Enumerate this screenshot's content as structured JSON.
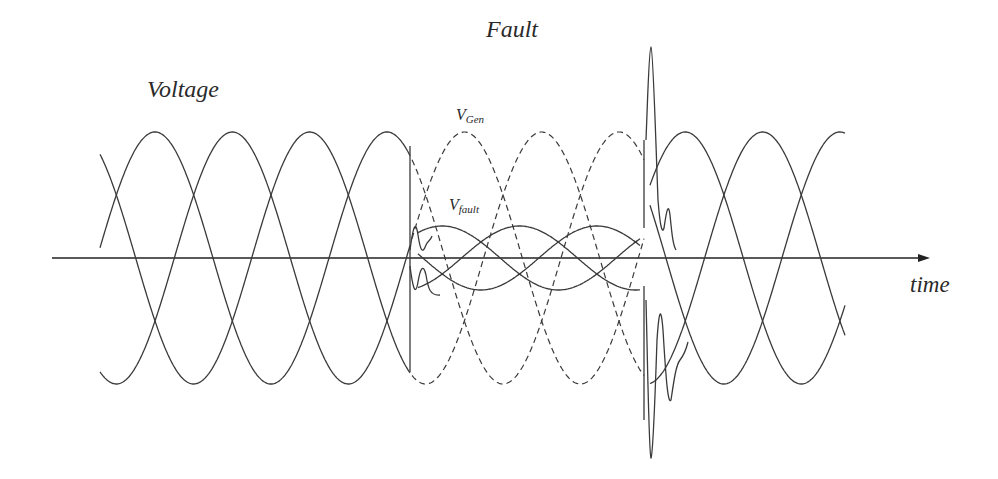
{
  "labels": {
    "voltage": "Voltage",
    "fault": "Fault",
    "time": "time",
    "v_gen_main": "V",
    "v_gen_sub": "Gen",
    "v_fault_main": "V",
    "v_fault_sub": "fault"
  },
  "colors": {
    "line": "#3a3a3a",
    "axis": "#222222",
    "background": "#ffffff"
  },
  "chart_data": {
    "type": "line",
    "title": "",
    "xlabel": "time",
    "ylabel": "Voltage",
    "annotations": [
      "Fault",
      "V_Gen",
      "V_fault"
    ],
    "grid": false,
    "phases": 3,
    "segments": [
      {
        "name": "pre-fault",
        "style": "solid",
        "relative_amplitude": 1.0,
        "phase_count": 3
      },
      {
        "name": "fault V_Gen",
        "style": "dashed",
        "relative_amplitude": 1.0,
        "phase_count": 3
      },
      {
        "name": "fault V_fault",
        "style": "solid",
        "relative_amplitude": 0.25,
        "phase_count": 3
      },
      {
        "name": "post-fault transient",
        "style": "solid",
        "peak_relative": 1.7,
        "trough_relative": -1.6
      },
      {
        "name": "post-fault",
        "style": "solid",
        "relative_amplitude": 1.0,
        "phase_count": 3
      }
    ],
    "pixel_layout": {
      "axis_y": 258,
      "axis_x_start": 52,
      "axis_x_end": 930,
      "amplitude_px": 126,
      "period_px": 232,
      "pre_fault_x": [
        100,
        410
      ],
      "fault_x": [
        410,
        650
      ],
      "post_fault_x": [
        650,
        845
      ],
      "fault_amplitude_px": 32
    }
  }
}
